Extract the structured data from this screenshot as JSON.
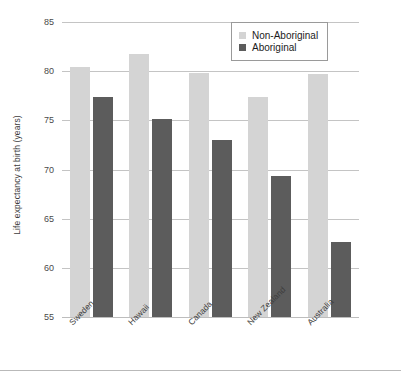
{
  "chart_data": {
    "type": "bar",
    "title": "",
    "subtitle": "",
    "xlabel": "",
    "ylabel": "Life expectancy at birth (years)",
    "ylim": [
      55,
      85
    ],
    "yticks": [
      55,
      60,
      65,
      70,
      75,
      80,
      85
    ],
    "grid": true,
    "legend_position": "top-right",
    "categories": [
      "Sweden",
      "Hawaii",
      "Canada",
      "New Zealand",
      "Australia"
    ],
    "series": [
      {
        "name": "Non-Aboriginal",
        "color": "#d4d4d4",
        "values": [
          80.4,
          81.7,
          79.8,
          77.4,
          79.7
        ]
      },
      {
        "name": "Aboriginal",
        "color": "#5c5c5c",
        "values": [
          77.4,
          75.1,
          73.0,
          69.3,
          62.6
        ]
      }
    ]
  },
  "axis": {
    "y_title": "Life expectancy at birth (years)",
    "tick_labels": [
      "85",
      "80",
      "75",
      "70",
      "65",
      "60",
      "55"
    ]
  },
  "legend": {
    "entries": [
      {
        "label": "Non-Aboriginal",
        "swatch": "light"
      },
      {
        "label": "Aboriginal",
        "swatch": "dark"
      }
    ]
  },
  "colors": {
    "series_light": "#d4d4d4",
    "series_dark": "#5c5c5c",
    "gridline": "#c4c4c4",
    "text": "#3d3d3d",
    "background": "#ffffff"
  }
}
